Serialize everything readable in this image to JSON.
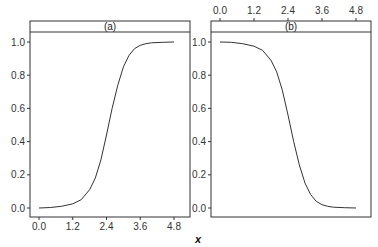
{
  "chart_data": [
    {
      "type": "line",
      "panel": "(a)",
      "title": "(a)",
      "xlabel": "x",
      "ylabel": "",
      "xlim": [
        -0.3,
        5.2
      ],
      "ylim": [
        -0.06,
        1.06
      ],
      "x_ticks": [
        "0.0",
        "1.2",
        "2.4",
        "3.6",
        "4.8"
      ],
      "y_ticks": [
        "0.0",
        "0.2",
        "0.4",
        "0.6",
        "0.8",
        "1.0"
      ],
      "x_axis_position": "bottom",
      "grid": false,
      "series": [
        {
          "name": "increasing sigmoid",
          "x": [
            0.0,
            0.4,
            0.8,
            1.2,
            1.5,
            1.8,
            2.0,
            2.2,
            2.4,
            2.6,
            2.8,
            3.0,
            3.2,
            3.4,
            3.6,
            3.8,
            4.0,
            4.4,
            4.8
          ],
          "y": [
            0.0,
            0.003,
            0.01,
            0.025,
            0.05,
            0.11,
            0.18,
            0.29,
            0.44,
            0.6,
            0.74,
            0.85,
            0.92,
            0.96,
            0.98,
            0.99,
            0.995,
            0.998,
            1.0
          ]
        }
      ]
    },
    {
      "type": "line",
      "panel": "(b)",
      "title": "(b)",
      "xlabel": "x",
      "ylabel": "",
      "xlim": [
        -0.3,
        5.2
      ],
      "ylim": [
        -0.06,
        1.06
      ],
      "x_ticks": [
        "0.0",
        "1.2",
        "2.4",
        "3.6",
        "4.8"
      ],
      "y_ticks": [
        "0.0",
        "0.2",
        "0.4",
        "0.6",
        "0.8",
        "1.0"
      ],
      "x_axis_position": "top",
      "grid": false,
      "series": [
        {
          "name": "decreasing sigmoid",
          "x": [
            0.0,
            0.4,
            0.8,
            1.2,
            1.5,
            1.8,
            2.0,
            2.2,
            2.4,
            2.6,
            2.8,
            3.0,
            3.2,
            3.4,
            3.6,
            3.8,
            4.0,
            4.4,
            4.8
          ],
          "y": [
            1.0,
            0.998,
            0.99,
            0.975,
            0.95,
            0.89,
            0.82,
            0.71,
            0.56,
            0.4,
            0.26,
            0.15,
            0.08,
            0.04,
            0.02,
            0.01,
            0.005,
            0.002,
            0.0
          ]
        }
      ]
    }
  ],
  "labels": {
    "panel_a": "(a)",
    "panel_b": "(b)",
    "xlabel": "x"
  },
  "colors": {
    "line": "#333333",
    "axis": "#333333",
    "background": "#ffffff"
  }
}
